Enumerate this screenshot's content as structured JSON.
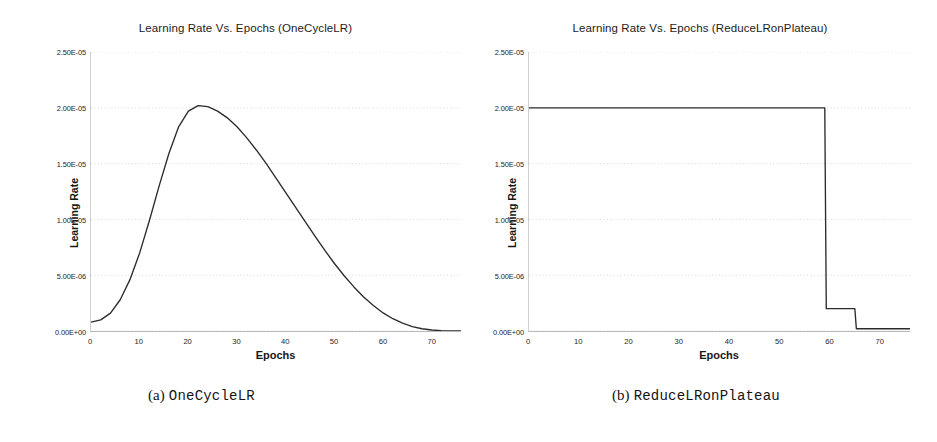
{
  "figure": {
    "background": "#ffffff",
    "axis_color": "#b9b9b9",
    "grid_color": "#d8d8d8",
    "line_color": "#2b2b2b"
  },
  "panels": [
    {
      "id": "a",
      "title": "Learning Rate Vs. Epochs (OneCycleLR)",
      "caption_marker": "(a)",
      "caption_name": "OneCycleLR",
      "xlabel": "Epochs",
      "ylabel": "Learning Rate",
      "yticks": [
        "2.50E-05",
        "2.00E-05",
        "1.50E-05",
        "1.00E-05",
        "5.00E-06",
        "0.00E+00"
      ],
      "xticks": [
        "0",
        "10",
        "20",
        "30",
        "40",
        "50",
        "60",
        "70"
      ]
    },
    {
      "id": "b",
      "title": "Learning Rate Vs. Epochs (ReduceLRonPlateau)",
      "caption_marker": "(b)",
      "caption_name": "ReduceLRonPlateau",
      "xlabel": "Epochs",
      "ylabel": "Learning Rate",
      "yticks": [
        "2.50E-05",
        "2.00E-05",
        "1.50E-05",
        "1.00E-05",
        "5.00E-06",
        "0.00E+00"
      ],
      "xticks": [
        "0",
        "10",
        "20",
        "30",
        "40",
        "50",
        "60",
        "70"
      ]
    }
  ],
  "chart_data": [
    {
      "type": "line",
      "panel": "a",
      "title": "Learning Rate Vs. Epochs (OneCycleLR)",
      "xlabel": "Epochs",
      "ylabel": "Learning Rate",
      "xlim": [
        0,
        76
      ],
      "ylim": [
        0,
        2.5e-05
      ],
      "ytick_values": [
        2.5e-05,
        2e-05,
        1.5e-05,
        1e-05,
        5e-06,
        0.0
      ],
      "xtick_values": [
        0,
        10,
        20,
        30,
        40,
        50,
        60,
        70
      ],
      "grid": true,
      "legend": null,
      "series": [
        {
          "name": "OneCycleLR learning rate",
          "x": [
            0,
            2,
            4,
            6,
            8,
            10,
            12,
            14,
            16,
            18,
            20,
            22,
            24,
            26,
            28,
            30,
            32,
            34,
            36,
            38,
            40,
            42,
            44,
            46,
            48,
            50,
            52,
            54,
            56,
            58,
            60,
            62,
            64,
            66,
            68,
            70,
            72,
            74,
            76
          ],
          "y": [
            8e-07,
            1e-06,
            1.6e-06,
            2.8e-06,
            4.6e-06,
            7e-06,
            9.9e-06,
            1.3e-05,
            1.59e-05,
            1.83e-05,
            1.97e-05,
            2.02e-05,
            2.01e-05,
            1.97e-05,
            1.91e-05,
            1.83e-05,
            1.73e-05,
            1.62e-05,
            1.5e-05,
            1.37e-05,
            1.24e-05,
            1.11e-05,
            9.8e-06,
            8.5e-06,
            7.25e-06,
            6.05e-06,
            4.95e-06,
            3.95e-06,
            3.05e-06,
            2.28e-06,
            1.62e-06,
            1.1e-06,
            7e-07,
            4e-07,
            2e-07,
            9e-08,
            3e-08,
            5e-09,
            0.0
          ]
        }
      ]
    },
    {
      "type": "line",
      "panel": "b",
      "title": "Learning Rate Vs. Epochs (ReduceLRonPlateau)",
      "xlabel": "Epochs",
      "ylabel": "Learning Rate",
      "xlim": [
        0,
        76
      ],
      "ylim": [
        0,
        2.5e-05
      ],
      "ytick_values": [
        2.5e-05,
        2e-05,
        1.5e-05,
        1e-05,
        5e-06,
        0.0
      ],
      "xtick_values": [
        0,
        10,
        20,
        30,
        40,
        50,
        60,
        70
      ],
      "grid": true,
      "legend": null,
      "series": [
        {
          "name": "ReduceLRonPlateau learning rate",
          "x": [
            0,
            59,
            59.3,
            65,
            65.3,
            76
          ],
          "y": [
            2e-05,
            2e-05,
            2e-06,
            2e-06,
            2e-07,
            2e-07
          ]
        }
      ]
    }
  ]
}
